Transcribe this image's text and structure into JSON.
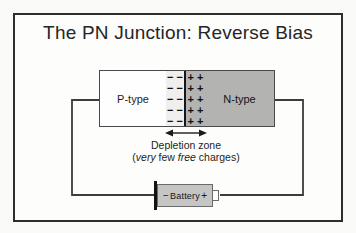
{
  "title": "The PN Junction: Reverse Bias",
  "junction": {
    "p_label": "P-type",
    "n_label": "N-type",
    "minus_rows": [
      "− −",
      "− −",
      "− −",
      "− −",
      "− −"
    ],
    "plus_rows": [
      "+ +",
      "+ +",
      "+ +",
      "+ +",
      "+ +"
    ]
  },
  "depletion": {
    "label": "Depletion zone",
    "sub": {
      "pre": "(",
      "it1": "very",
      "mid": " few ",
      "it2": "free",
      "post": " charges)"
    }
  },
  "battery": {
    "minus_sign": "−",
    "label": "Battery",
    "plus_sign": "+"
  },
  "colors": {
    "frame_border": "#2d2d2d",
    "n_type_gray": "#b3b3b2",
    "depletion_light": "#f0efed",
    "battery_gray": "#c5c5c4",
    "wire": "#3c3c3c",
    "text": "#1d1d1d"
  }
}
